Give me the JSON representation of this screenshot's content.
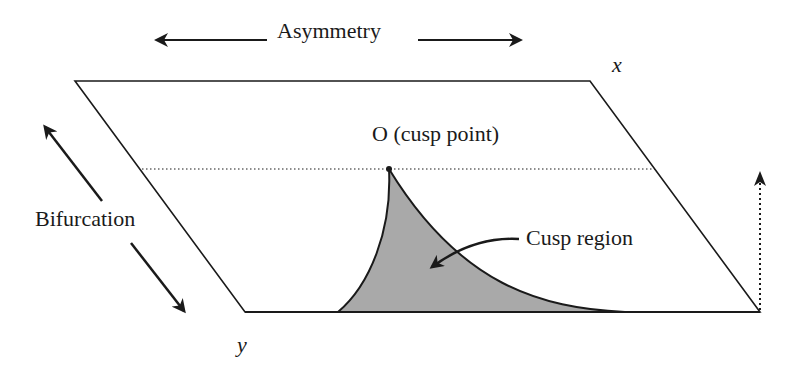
{
  "diagram": {
    "type": "cusp-catastrophe-control-plane",
    "labels": {
      "asymmetry": "Asymmetry",
      "bifurcation": "Bifurcation",
      "x_axis": "x",
      "y_axis": "y",
      "cusp_point": "O (cusp point)",
      "cusp_region": "Cusp region"
    },
    "colors": {
      "line": "#1a1a1a",
      "cusp_fill": "#a9a9a9",
      "background": "#ffffff"
    },
    "plane_corners": {
      "top_left": [
        75,
        81
      ],
      "top_right": [
        590,
        81
      ],
      "bottom_right": [
        760,
        312
      ],
      "bottom_left": [
        245,
        312
      ]
    },
    "cusp_point": [
      389,
      169
    ]
  }
}
